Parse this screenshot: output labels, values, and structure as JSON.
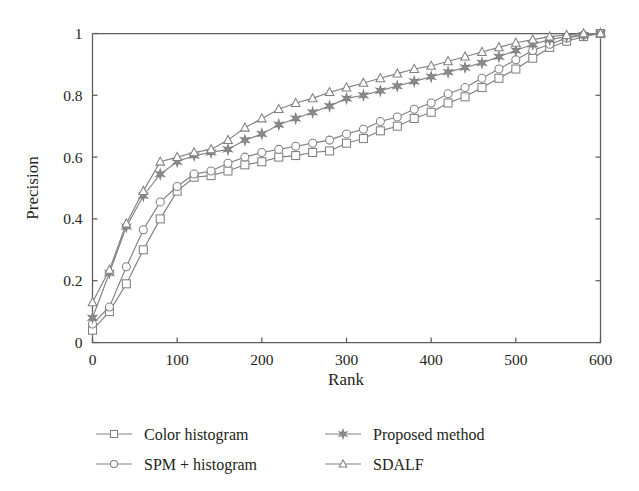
{
  "chart_data": {
    "type": "line",
    "title": "",
    "xlabel": "Rank",
    "ylabel": "Precision",
    "xlim": [
      0,
      600
    ],
    "ylim": [
      0,
      1
    ],
    "xticks": [
      0,
      100,
      200,
      300,
      400,
      500,
      600
    ],
    "xtick_labels": [
      "0",
      "100",
      "200",
      "300",
      "400",
      "500",
      "600"
    ],
    "yticks": [
      0,
      0.2,
      0.4,
      0.6,
      0.8,
      1
    ],
    "ytick_labels": [
      "0",
      "0.2",
      "0.4",
      "0.6",
      "0.8",
      "1"
    ],
    "grid": false,
    "legend_position": "below-axes",
    "line_color": "#808080",
    "x": [
      0,
      20,
      40,
      60,
      80,
      100,
      120,
      140,
      160,
      180,
      200,
      220,
      240,
      260,
      280,
      300,
      320,
      340,
      360,
      380,
      400,
      420,
      440,
      460,
      480,
      500,
      520,
      540,
      560,
      580,
      600
    ],
    "series": [
      {
        "name": "Color histogram",
        "marker": "open-square",
        "values": [
          0.04,
          0.1,
          0.19,
          0.3,
          0.4,
          0.49,
          0.535,
          0.54,
          0.555,
          0.575,
          0.585,
          0.6,
          0.605,
          0.615,
          0.62,
          0.645,
          0.66,
          0.685,
          0.7,
          0.725,
          0.745,
          0.775,
          0.795,
          0.825,
          0.855,
          0.885,
          0.92,
          0.955,
          0.975,
          0.99,
          1.0
        ]
      },
      {
        "name": "SPM + histogram",
        "marker": "open-circle",
        "values": [
          0.06,
          0.115,
          0.245,
          0.365,
          0.455,
          0.505,
          0.545,
          0.555,
          0.58,
          0.6,
          0.615,
          0.625,
          0.635,
          0.645,
          0.655,
          0.675,
          0.69,
          0.715,
          0.73,
          0.755,
          0.775,
          0.805,
          0.825,
          0.855,
          0.885,
          0.915,
          0.945,
          0.965,
          0.985,
          0.995,
          1.0
        ]
      },
      {
        "name": "Proposed method",
        "marker": "filled-star",
        "values": [
          0.08,
          0.225,
          0.375,
          0.475,
          0.545,
          0.585,
          0.605,
          0.615,
          0.625,
          0.655,
          0.675,
          0.705,
          0.725,
          0.745,
          0.765,
          0.79,
          0.8,
          0.815,
          0.83,
          0.845,
          0.86,
          0.875,
          0.89,
          0.905,
          0.925,
          0.945,
          0.965,
          0.98,
          0.99,
          0.995,
          1.0
        ]
      },
      {
        "name": "SDALF",
        "marker": "open-triangle",
        "values": [
          0.13,
          0.235,
          0.385,
          0.49,
          0.585,
          0.6,
          0.615,
          0.625,
          0.655,
          0.695,
          0.725,
          0.755,
          0.775,
          0.79,
          0.81,
          0.825,
          0.84,
          0.855,
          0.87,
          0.885,
          0.895,
          0.91,
          0.925,
          0.94,
          0.955,
          0.97,
          0.98,
          0.99,
          0.995,
          1.0,
          1.0
        ]
      }
    ]
  },
  "legend": {
    "entries": [
      {
        "label": "Color histogram",
        "marker": "open-square"
      },
      {
        "label": "SPM + histogram",
        "marker": "open-circle"
      },
      {
        "label": "Proposed method",
        "marker": "filled-star"
      },
      {
        "label": "SDALF",
        "marker": "open-triangle"
      }
    ]
  }
}
